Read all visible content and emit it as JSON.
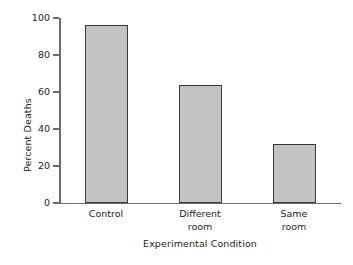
{
  "chart_data": {
    "type": "bar",
    "title": "",
    "categories": [
      "Control",
      "Different room",
      "Same room"
    ],
    "category_labels_wrapped": [
      "Control",
      "Different\nroom",
      "Same\nroom"
    ],
    "values": [
      96,
      64,
      32
    ],
    "xlabel": "Experimental Condition",
    "ylabel": "Percent Deaths",
    "ylim": [
      0,
      100
    ],
    "yticks": [
      0,
      20,
      40,
      60,
      80,
      100
    ],
    "ytick_labels": [
      "0",
      "20",
      "40",
      "60",
      "80",
      "100"
    ],
    "grid": false,
    "legend": null,
    "series": [
      {
        "name": "Percent Deaths",
        "values": [
          96,
          64,
          32
        ]
      }
    ],
    "colors": {
      "bar_fill": "#c3c3c3",
      "bar_edge": "#3a3a3a",
      "axis": "#6d6d6d",
      "text": "#242424",
      "background": "#ffffff"
    }
  },
  "axes": {
    "y_title": "Percent Deaths",
    "x_title": "Experimental Condition"
  }
}
